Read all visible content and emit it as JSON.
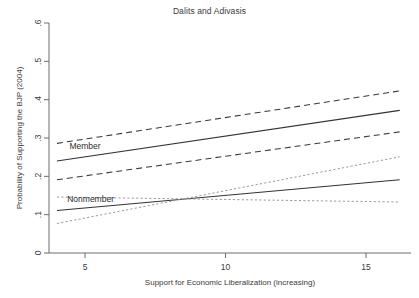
{
  "chart_data": {
    "type": "line",
    "title": "Dalits and Adivasis",
    "xlabel": "Support for Economic Liberalization (increasing)",
    "ylabel": "Probability of Supporting the BJP (2004)",
    "xlim": [
      3.2,
      16.8
    ],
    "ylim": [
      0,
      0.6
    ],
    "xticks": [
      5,
      10,
      15
    ],
    "xtick_labels": [
      "5",
      "10",
      "15"
    ],
    "yticks": [
      0,
      0.1,
      0.2,
      0.3,
      0.4,
      0.5,
      0.6
    ],
    "ytick_labels": [
      "0",
      ".1",
      ".2",
      ".3",
      ".4",
      ".5",
      ".6"
    ],
    "grid": false,
    "legend": "inline-annotations",
    "annotations": [
      {
        "text": "Member",
        "x": 5.0,
        "y": 0.272
      },
      {
        "text": "Nonmember",
        "x": 5.2,
        "y": 0.133
      }
    ],
    "x": [
      4.0,
      16.2
    ],
    "series": [
      {
        "name": "Member predicted probability",
        "style": "solid",
        "values": [
          0.24,
          0.372
        ]
      },
      {
        "name": "Member 95% CI upper",
        "style": "dashed",
        "values": [
          0.286,
          0.423
        ]
      },
      {
        "name": "Member 95% CI lower",
        "style": "dashed",
        "values": [
          0.191,
          0.316
        ]
      },
      {
        "name": "Nonmember predicted probability",
        "style": "solid",
        "values": [
          0.111,
          0.191
        ]
      },
      {
        "name": "Nonmember 95% CI upper",
        "style": "dotted",
        "values": [
          0.077,
          0.251
        ]
      },
      {
        "name": "Nonmember 95% CI lower",
        "style": "dotted",
        "values": [
          0.146,
          0.133
        ]
      }
    ]
  }
}
